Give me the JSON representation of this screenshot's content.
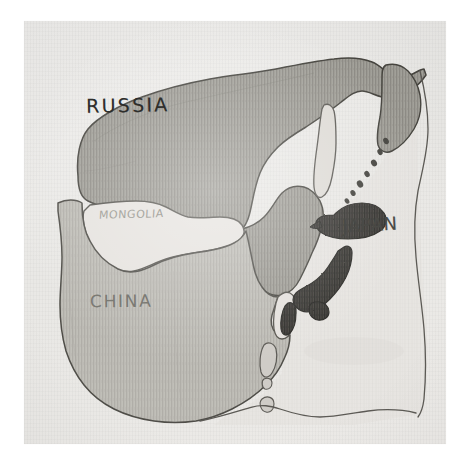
{
  "figure": {
    "kind": "hand-drawn-pencil-map",
    "medium": "graphite pencil on paper",
    "background_color": "#ffffff",
    "paper_color": "#ece9e6"
  },
  "labels": {
    "russia": "RUSSIA",
    "mongolia": "MONGOLIA",
    "china": "CHINA",
    "japan": "JAPAN"
  },
  "regions": [
    {
      "name": "Russia",
      "label": "RUSSIA",
      "shading": "dark-gray hatched",
      "fill_color": "#9a9891",
      "outline_color": "#4b4a46"
    },
    {
      "name": "Mongolia",
      "label": "MONGOLIA",
      "shading": "unshaded / paper",
      "fill_color": "#e7e4e0",
      "outline_color": "#55534f"
    },
    {
      "name": "China",
      "label": "CHINA",
      "shading": "light-gray hatched",
      "fill_color": "#bab8b2",
      "outline_color": "#4f4e4a"
    },
    {
      "name": "Korean Peninsula",
      "label": "",
      "shading": "unshaded outline",
      "fill_color": "#e5e2de",
      "outline_color": "#55534f"
    },
    {
      "name": "Japan",
      "label": "JAPAN",
      "shading": "very dark graphite",
      "fill_color": "#3b3a36",
      "outline_color": "#2a2927"
    },
    {
      "name": "Sakhalin",
      "label": "",
      "shading": "unshaded outline",
      "fill_color": "#dedbd7",
      "outline_color": "#5a5854"
    },
    {
      "name": "Kamchatka",
      "label": "",
      "shading": "dark-gray hatched",
      "fill_color": "#9a9891",
      "outline_color": "#4b4a46"
    },
    {
      "name": "Kuril Islands",
      "label": "",
      "shading": "chain of dark dots",
      "fill_color": "#44433f",
      "outline_color": "#44433f"
    },
    {
      "name": "Taiwan",
      "label": "",
      "shading": "light outline",
      "fill_color": "#cecbc6",
      "outline_color": "#5a5854"
    }
  ],
  "features": {
    "kuril_dot_count": 7,
    "southern_sea_boundary": "wavy pencil line across lower ocean",
    "ocean_label": ""
  },
  "colors": {
    "paper": "#ece9e6",
    "russia_fill": "#9a9891",
    "china_fill": "#bab8b2",
    "japan_fill": "#3b3a36",
    "ocean": "#e3e0dc",
    "pencil_line": "#4b4a46"
  }
}
